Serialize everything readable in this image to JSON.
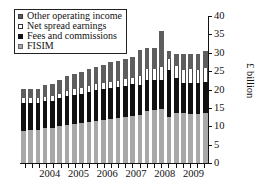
{
  "chart_data": {
    "type": "bar",
    "title": "",
    "subtitle": "",
    "xlabel": "",
    "ylabel": "£ billion",
    "ylim": [
      0,
      40
    ],
    "yticks": [
      0,
      5,
      10,
      15,
      20,
      25,
      30,
      35,
      40
    ],
    "ytick_labels": [
      "0",
      "5",
      "10",
      "15",
      "20",
      "25",
      "30",
      "35",
      "40"
    ],
    "grid": false,
    "stacked": true,
    "legend_position": "upper-left",
    "legend_entries": [
      "Other operating income",
      "Net spread earnings",
      "Fees and commissions",
      "FISIM"
    ],
    "colors": {
      "other_operating_income": "#5e5e5e",
      "net_spread_earnings": "#ffffff",
      "fees_and_commissions": "#111111",
      "fisim": "#a8a8a8"
    },
    "x_axis_tick_labels": [
      "2004",
      "2005",
      "2006",
      "2007",
      "2008",
      "2009"
    ],
    "categories": [
      "2003 Q3",
      "2003 Q4",
      "2004 Q1",
      "2004 Q2",
      "2004 Q3",
      "2004 Q4",
      "2005 Q1",
      "2005 Q2",
      "2005 Q3",
      "2005 Q4",
      "2006 Q1",
      "2006 Q2",
      "2006 Q3",
      "2006 Q4",
      "2007 Q1",
      "2007 Q2",
      "2007 Q3",
      "2007 Q4",
      "2008 Q1",
      "2008 Q2",
      "2008 Q3",
      "2008 Q4",
      "2009 Q1",
      "2009 Q2",
      "2009 Q3",
      "2009 Q4"
    ],
    "series": [
      {
        "name": "FISIM",
        "values": [
          8.8,
          8.9,
          9.1,
          9.4,
          9.6,
          10.0,
          10.3,
          10.6,
          10.8,
          11.1,
          11.4,
          11.7,
          12.0,
          12.3,
          12.5,
          12.8,
          13.1,
          14.2,
          14.5,
          14.7,
          12.6,
          13.6,
          13.5,
          13.4,
          13.4,
          13.6
        ]
      },
      {
        "name": "Fees and commissions",
        "values": [
          7.4,
          7.3,
          7.2,
          7.4,
          7.3,
          7.6,
          7.9,
          7.9,
          8.1,
          8.2,
          8.4,
          8.5,
          8.5,
          8.4,
          8.5,
          8.6,
          8.0,
          8.3,
          8.2,
          8.0,
          12.8,
          9.4,
          8.3,
          8.4,
          8.4,
          8.5
        ]
      },
      {
        "name": "Net spread earnings",
        "values": [
          1.5,
          1.4,
          1.3,
          1.3,
          1.4,
          1.3,
          1.5,
          1.6,
          1.5,
          1.6,
          1.7,
          1.7,
          1.6,
          1.7,
          1.8,
          1.8,
          2.7,
          3.0,
          2.9,
          3.3,
          3.0,
          3.4,
          3.6,
          3.8,
          3.6,
          3.7
        ]
      },
      {
        "name": "Other operating income",
        "values": [
          2.5,
          2.6,
          2.6,
          3.2,
          3.3,
          3.6,
          3.9,
          4.2,
          4.5,
          4.6,
          4.7,
          4.9,
          5.3,
          5.4,
          5.5,
          5.6,
          7.1,
          5.8,
          5.6,
          10.0,
          2.1,
          3.4,
          4.2,
          4.0,
          4.3,
          4.7
        ]
      }
    ],
    "totals": [
      20.2,
      20.2,
      20.2,
      21.3,
      21.6,
      22.5,
      23.6,
      24.3,
      24.9,
      25.5,
      26.2,
      26.8,
      27.4,
      27.8,
      28.3,
      28.8,
      30.9,
      31.3,
      31.2,
      36.0,
      30.5,
      29.8,
      29.6,
      29.6,
      29.7,
      30.5
    ]
  }
}
